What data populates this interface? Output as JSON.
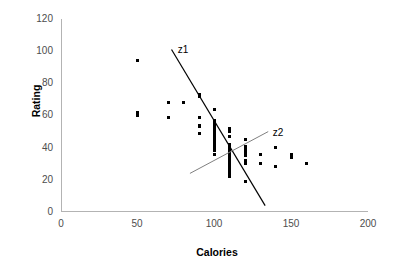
{
  "chart_data": {
    "type": "scatter",
    "title": "",
    "xlabel": "Calories",
    "ylabel": "Rating",
    "xlim": [
      0,
      200
    ],
    "ylim": [
      0,
      120
    ],
    "xticks": [
      0,
      50,
      100,
      150,
      200
    ],
    "yticks": [
      0,
      20,
      40,
      60,
      80,
      100,
      120
    ],
    "grid": false,
    "legend": "none",
    "marker_color": "#000000",
    "series": [
      {
        "name": "cereals",
        "x": [
          50,
          50,
          50,
          70,
          70,
          80,
          90,
          90,
          90,
          90,
          90,
          90,
          100,
          100,
          100,
          100,
          100,
          100,
          100,
          100,
          100,
          100,
          100,
          100,
          100,
          100,
          100,
          100,
          100,
          100,
          100,
          100,
          110,
          110,
          110,
          110,
          110,
          110,
          110,
          110,
          110,
          110,
          110,
          110,
          110,
          110,
          110,
          110,
          110,
          110,
          110,
          110,
          110,
          110,
          110,
          110,
          110,
          120,
          120,
          120,
          120,
          120,
          120,
          120,
          120,
          120,
          130,
          130,
          140,
          140,
          150,
          150,
          160
        ],
        "y": [
          94,
          62,
          60,
          68,
          59,
          68,
          73,
          72,
          59,
          54,
          53,
          49,
          64,
          57,
          55,
          54,
          53,
          52,
          51,
          50,
          49,
          47,
          46,
          45,
          44,
          43,
          42,
          41,
          40,
          39,
          38,
          36,
          52,
          50,
          47,
          42,
          41,
          40,
          39,
          38,
          37,
          36,
          35,
          34,
          33,
          32,
          31,
          30,
          29,
          28,
          27,
          26,
          25,
          24,
          23,
          22,
          41,
          45,
          41,
          39,
          38,
          37,
          35,
          32,
          30,
          19,
          36,
          30,
          40,
          28,
          36,
          34,
          30
        ]
      }
    ],
    "annotations": [
      {
        "label": "z1",
        "kind": "line",
        "color": "#000000",
        "width": 1.2,
        "x0": 72,
        "y0": 101,
        "x1": 133,
        "y1": 4,
        "label_x": 76,
        "label_y": 101
      },
      {
        "label": "z2",
        "kind": "line",
        "color": "#808080",
        "width": 1.0,
        "x0": 84,
        "y0": 24,
        "x1": 135,
        "y1": 50,
        "label_x": 138,
        "label_y": 49
      }
    ]
  }
}
